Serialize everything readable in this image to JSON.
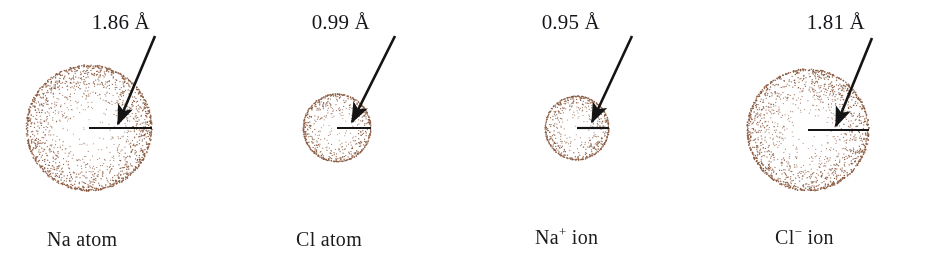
{
  "figure": {
    "background_color": "#ffffff",
    "dot_color": "#8a5a40",
    "line_color": "#141414",
    "text_color": "#16141a"
  },
  "panels": [
    {
      "id": "na-atom",
      "species_label": "Na atom",
      "species_symbol": "Na",
      "species_charge": "",
      "species_kind": "atom",
      "measurement": "1.86 Å",
      "radius_value": 1.86,
      "radius_unit": "Å",
      "sphere": {
        "cx": 89,
        "cy": 128,
        "r": 63,
        "dot_count": 1250
      },
      "radius_line": {
        "x1": 89,
        "y1": 128,
        "x2": 152,
        "y2": 128
      },
      "arrow": {
        "x1": 155,
        "y1": 36,
        "x2": 118,
        "y2": 124
      },
      "measure_label_pos": {
        "x": 150,
        "y": 10
      },
      "species_label_pos": {
        "x": 47,
        "y": 228
      }
    },
    {
      "id": "cl-atom",
      "species_label": "Cl atom",
      "species_symbol": "Cl",
      "species_charge": "",
      "species_kind": "atom",
      "measurement": "0.99 Å",
      "radius_value": 0.99,
      "radius_unit": "Å",
      "sphere": {
        "cx": 337,
        "cy": 128,
        "r": 34,
        "dot_count": 430
      },
      "radius_line": {
        "x1": 337,
        "y1": 128,
        "x2": 371,
        "y2": 128
      },
      "arrow": {
        "x1": 395,
        "y1": 36,
        "x2": 352,
        "y2": 122
      },
      "measure_label_pos": {
        "x": 370,
        "y": 10
      },
      "species_label_pos": {
        "x": 296,
        "y": 228
      }
    },
    {
      "id": "na-ion",
      "species_label": "Na+ ion",
      "species_symbol": "Na",
      "species_charge": "+",
      "species_kind": "ion",
      "measurement": "0.95 Å",
      "radius_value": 0.95,
      "radius_unit": "Å",
      "sphere": {
        "cx": 577,
        "cy": 128,
        "r": 32,
        "dot_count": 390
      },
      "radius_line": {
        "x1": 577,
        "y1": 128,
        "x2": 609,
        "y2": 128
      },
      "arrow": {
        "x1": 632,
        "y1": 36,
        "x2": 592,
        "y2": 122
      },
      "measure_label_pos": {
        "x": 600,
        "y": 10
      },
      "species_label_pos": {
        "x": 535,
        "y": 226
      }
    },
    {
      "id": "cl-ion",
      "species_label": "Cl− ion",
      "species_symbol": "Cl",
      "species_charge": "−",
      "species_kind": "ion",
      "measurement": "1.81 Å",
      "radius_value": 1.81,
      "radius_unit": "Å",
      "sphere": {
        "cx": 808,
        "cy": 130,
        "r": 61,
        "dot_count": 1180
      },
      "radius_line": {
        "x1": 808,
        "y1": 130,
        "x2": 869,
        "y2": 130
      },
      "arrow": {
        "x1": 872,
        "y1": 38,
        "x2": 836,
        "y2": 126
      },
      "measure_label_pos": {
        "x": 865,
        "y": 10
      },
      "species_label_pos": {
        "x": 775,
        "y": 226
      }
    }
  ]
}
